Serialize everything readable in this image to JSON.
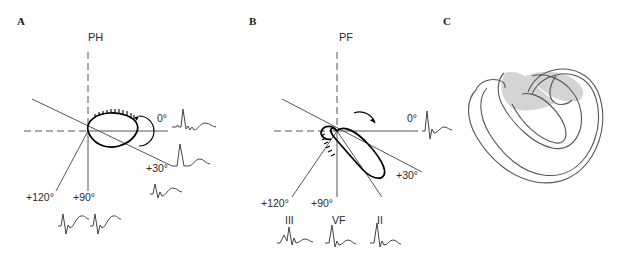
{
  "figure": {
    "width": 629,
    "height": 268,
    "background": "#ffffff",
    "ink_color": "#2b2b2b",
    "shade_color": "#d4d4d4"
  },
  "panels": [
    {
      "id": "A",
      "label": "A",
      "label_x": 17,
      "label_y": 16,
      "plane_title": "PH",
      "plane_title_x": 88,
      "plane_title_y": 32,
      "origin_x": 88,
      "origin_y": 131,
      "angles": [
        {
          "name": "zero",
          "label": "0°",
          "value": 0,
          "label_x": 157,
          "label_y": 113
        },
        {
          "name": "plus30",
          "label": "+30°",
          "value": 30,
          "label_x": 146,
          "label_y": 163
        },
        {
          "name": "plus90",
          "label": "+90°",
          "value": 90,
          "label_x": 73,
          "label_y": 192
        },
        {
          "name": "plus120",
          "label": "+120°",
          "value": 120,
          "label_x": 26,
          "label_y": 192
        }
      ],
      "lead_labels": [],
      "loop": {
        "type": "vector-loop",
        "orientation_deg": 0,
        "major_radius": 31,
        "minor_radius": 13,
        "tilt_deg": -8,
        "description": "horizontal-plane QRS loop, nearly flat, directed leftward-forward"
      },
      "rotation_arrow": {
        "cx": 130,
        "cy": 131,
        "direction": "clockwise"
      },
      "ecg_tracings": [
        {
          "name": "ecg-zero",
          "x": 172,
          "y": 113
        },
        {
          "name": "ecg-plus30",
          "x": 172,
          "y": 152
        },
        {
          "name": "ecg-plus30-lower",
          "x": 150,
          "y": 188
        },
        {
          "name": "ecg-plus90",
          "x": 90,
          "y": 220
        },
        {
          "name": "ecg-plus120",
          "x": 58,
          "y": 220
        }
      ]
    },
    {
      "id": "B",
      "label": "B",
      "label_x": 249,
      "label_y": 16,
      "plane_title": "PF",
      "plane_title_x": 339,
      "plane_title_y": 32,
      "origin_x": 337,
      "origin_y": 131,
      "angles": [
        {
          "name": "zero",
          "label": "0°",
          "value": 0,
          "label_x": 407,
          "label_y": 113
        },
        {
          "name": "plus30",
          "label": "+30°",
          "value": 30,
          "label_x": 396,
          "label_y": 170
        },
        {
          "name": "plus90",
          "label": "+90°",
          "value": 90,
          "label_x": 311,
          "label_y": 198
        },
        {
          "name": "plus120",
          "label": "+120°",
          "value": 120,
          "label_x": 261,
          "label_y": 198
        }
      ],
      "lead_labels": [
        {
          "name": "lead-III",
          "label": "III",
          "x": 285,
          "y": 215
        },
        {
          "name": "lead-VF",
          "label": "VF",
          "x": 332,
          "y": 215
        },
        {
          "name": "lead-II",
          "label": "II",
          "x": 377,
          "y": 215
        }
      ],
      "loop": {
        "type": "vector-loop",
        "orientation_deg": 55,
        "major_radius": 34,
        "minor_radius": 15,
        "tilt_deg": 52,
        "description": "frontal-plane QRS loop, long axis directed inferior-right toward +60 degrees"
      },
      "rotation_arrow": {
        "cx": 368,
        "cy": 122,
        "direction": "clockwise"
      },
      "ecg_tracings": [
        {
          "name": "ecg-zero",
          "x": 422,
          "y": 113
        },
        {
          "name": "ecg-lead-III",
          "x": 277,
          "y": 232
        },
        {
          "name": "ecg-lead-VF",
          "x": 325,
          "y": 232
        },
        {
          "name": "ecg-lead-II",
          "x": 370,
          "y": 232
        }
      ]
    },
    {
      "id": "C",
      "label": "C",
      "label_x": 443,
      "label_y": 16,
      "plane_title": "",
      "plane_title_x": 0,
      "plane_title_y": 0,
      "origin_x": 0,
      "origin_y": 0,
      "angles": [],
      "lead_labels": [],
      "loop": {
        "type": "anatomical-drawing",
        "orientation_deg": 0,
        "major_radius": 0,
        "minor_radius": 0,
        "tilt_deg": 0,
        "description": "three-dimensional horseshoe shaped myocardial band drawing with shaded band segment"
      },
      "rotation_arrow": null,
      "ecg_tracings": []
    }
  ]
}
